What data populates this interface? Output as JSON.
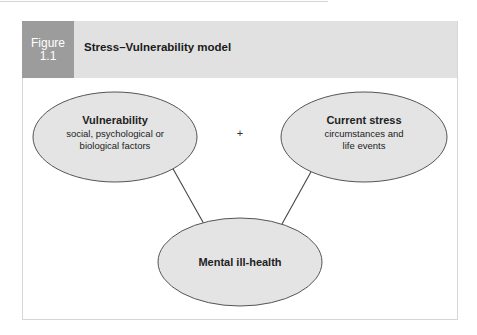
{
  "figure": {
    "label_line1": "Figure",
    "label_line2": "1.1",
    "title": "Stress–Vulnerability model"
  },
  "colors": {
    "header_band": "#e1e1e1",
    "figure_label_bg": "#9c9c9c",
    "ellipse_fill": "#e4e4e4",
    "ellipse_stroke": "#555555",
    "connector": "#444444"
  },
  "nodes": [
    {
      "id": "vulnerability",
      "heading": "Vulnerability",
      "line1": "social, psychological or",
      "line2": "biological factors"
    },
    {
      "id": "current-stress",
      "heading": "Current stress",
      "line1": "circumstances and",
      "line2": "life events"
    },
    {
      "id": "mental-ill-health",
      "heading": "Mental ill-health"
    }
  ],
  "operator": "+",
  "edges": [
    {
      "from": "vulnerability",
      "to": "mental-ill-health"
    },
    {
      "from": "current-stress",
      "to": "mental-ill-health"
    }
  ]
}
